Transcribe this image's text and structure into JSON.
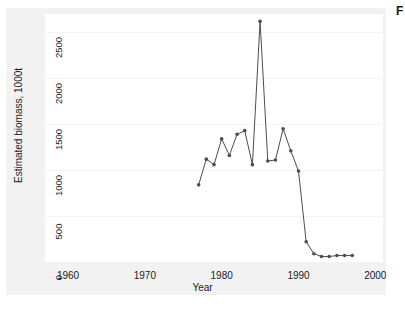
{
  "figure": {
    "corner_label": "F",
    "background_color": "#f2f2f2",
    "panel_color": "#ffffff",
    "series_color": "#4d4d4d"
  },
  "chart_data": {
    "type": "line",
    "title": "",
    "xlabel": "Year",
    "ylabel": "Estimated biomass, 1000t",
    "xlim": [
      1957,
      2001
    ],
    "ylim": [
      0,
      2700
    ],
    "xticks": [
      1960,
      1970,
      1980,
      1990,
      2000
    ],
    "xtick_labels": [
      "1960",
      "1970",
      "1980",
      "1990",
      "2000"
    ],
    "yticks": [
      0,
      500,
      1000,
      1500,
      2000,
      2500
    ],
    "ytick_labels": [
      "0",
      "500",
      "1000",
      "1500",
      "2000",
      "2500"
    ],
    "grid": true,
    "legend": "none",
    "markers": "filled-circle",
    "series": [
      {
        "name": "Estimated biomass",
        "x": [
          1977,
          1978,
          1979,
          1980,
          1981,
          1982,
          1983,
          1984,
          1985,
          1986,
          1987,
          1988,
          1989,
          1990,
          1991,
          1992,
          1993,
          1994,
          1995,
          1996,
          1997
        ],
        "values": [
          840,
          1120,
          1060,
          1340,
          1160,
          1390,
          1430,
          1060,
          2620,
          1100,
          1110,
          1450,
          1210,
          990,
          220,
          90,
          60,
          60,
          70,
          70,
          70
        ]
      }
    ]
  }
}
